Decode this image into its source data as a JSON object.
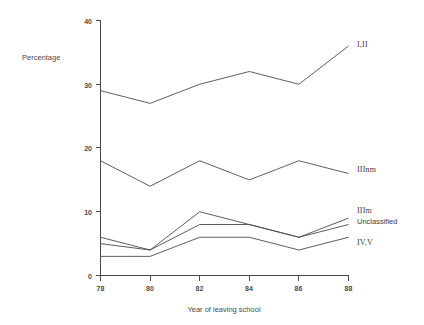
{
  "chart_data": {
    "type": "line",
    "title": "",
    "xlabel": "Year of leaving school",
    "ylabel": "Percentage",
    "x": [
      78,
      80,
      82,
      84,
      86,
      88
    ],
    "xtick_labels": [
      "78",
      "80",
      "82",
      "84",
      "86",
      "88"
    ],
    "ytick_labels": [
      "0",
      "10",
      "20",
      "30",
      "40"
    ],
    "yticks": [
      0,
      10,
      20,
      30,
      40
    ],
    "xlim": [
      78,
      88
    ],
    "ylim": [
      0,
      40
    ],
    "grid": false,
    "legend_position": "right-of-plot-inline",
    "series": [
      {
        "name": "I,II",
        "values": [
          29,
          27,
          30,
          32,
          30,
          36
        ]
      },
      {
        "name": "IIInm",
        "values": [
          18,
          14,
          18,
          15,
          18,
          16
        ]
      },
      {
        "name": "IIIm",
        "values": [
          5,
          4,
          10,
          8,
          6,
          9
        ]
      },
      {
        "name": "Unclassified",
        "values": [
          6,
          4,
          8,
          8,
          6,
          8
        ]
      },
      {
        "name": "IV,V",
        "values": [
          3,
          3,
          6,
          6,
          4,
          6
        ]
      }
    ],
    "line_color": "#4c4c4c",
    "axis_color": "#4a4a4a",
    "background_color": "#ffffff"
  },
  "labels": {
    "y_axis_title": "Percentage",
    "x_axis_title": "Year of leaving school",
    "series_label_0": "I,II",
    "series_label_1": "IIInm",
    "series_label_2": "IIIm",
    "series_label_3": "Unclassified",
    "series_label_4": "IV,V",
    "ytick_0": "0",
    "ytick_1": "10",
    "ytick_2": "20",
    "ytick_3": "30",
    "ytick_4": "40",
    "xtick_0": "78",
    "xtick_1": "80",
    "xtick_2": "82",
    "xtick_3": "84",
    "xtick_4": "86",
    "xtick_5": "88"
  }
}
